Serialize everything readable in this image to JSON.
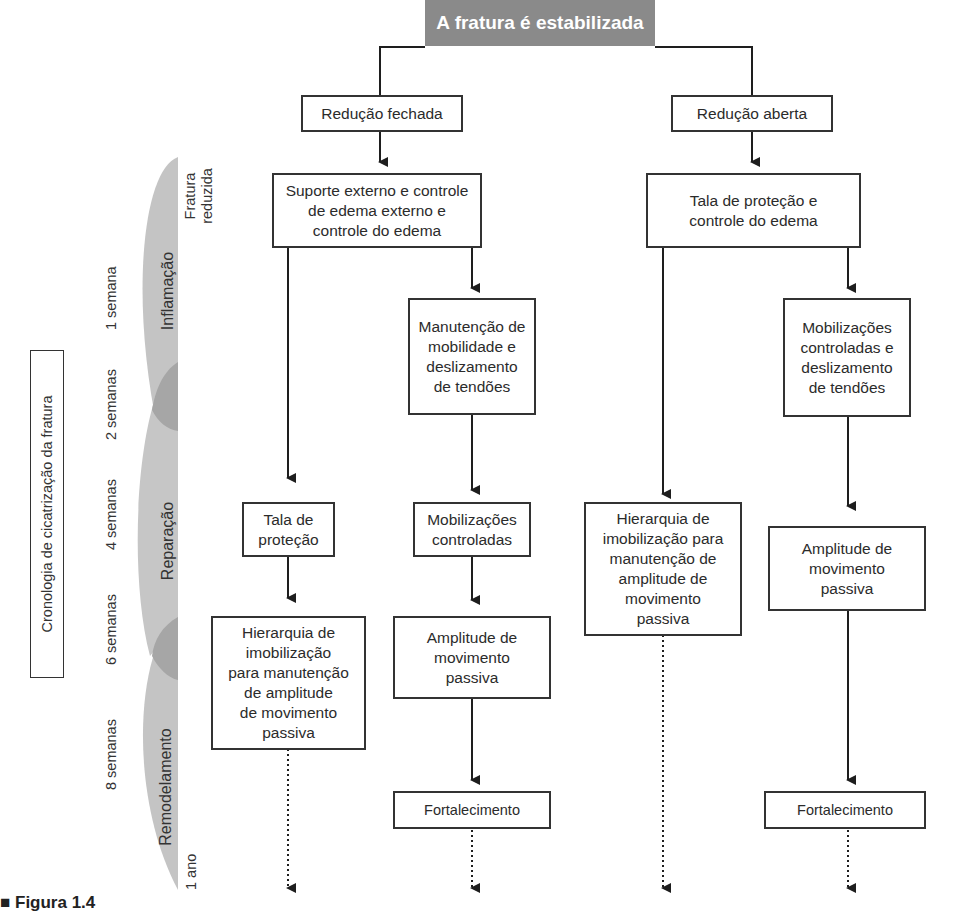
{
  "title": "A fratura é estabilizada",
  "branches": {
    "closed": {
      "label": "Redução fechada",
      "step1": "Suporte externo e controle\nde edema externo e\ncontrole do edema",
      "left_col": {
        "b1": "Tala de\nproteção",
        "b2": "Hierarquia de\nimobilização\npara manutenção\nde amplitude\nde movimento\npassiva"
      },
      "right_col": {
        "b1": "Manutenção de\nmobilidade e\ndeslizamento\nde tendões",
        "b2": "Mobilizações\ncontroladas",
        "b3": "Amplitude de\nmovimento\npassiva",
        "b4": "Fortalecimento"
      }
    },
    "open": {
      "label": "Redução aberta",
      "step1": "Tala de proteção e\ncontrole do edema",
      "left_col": {
        "b1": "Hierarquia de\nimobilização para\nmanutenção de\namplitude de\nmovimento\npassiva"
      },
      "right_col": {
        "b1": "Mobilizações\ncontroladas e\ndeslizamento\nde tendões",
        "b2": "Amplitude de\nmovimento\npassiva",
        "b3": "Fortalecimento"
      }
    }
  },
  "timeline": {
    "label": "Cronologia de cicatrização da fratura",
    "phases": [
      "Inflamação",
      "Reparação",
      "Remodelamento"
    ],
    "ticks": [
      "Fratura\nreduzida",
      "1 semana",
      "2 semanas",
      "4 semanas",
      "6 semanas",
      "8 semanas",
      "1 ano"
    ]
  },
  "caption": "■ Figura 1.4",
  "colors": {
    "title_bg": "#8a8a8a",
    "phase_fill": "#c4c4c4",
    "overlap_fill": "#a6a6a6",
    "line": "#1e1e1e"
  }
}
